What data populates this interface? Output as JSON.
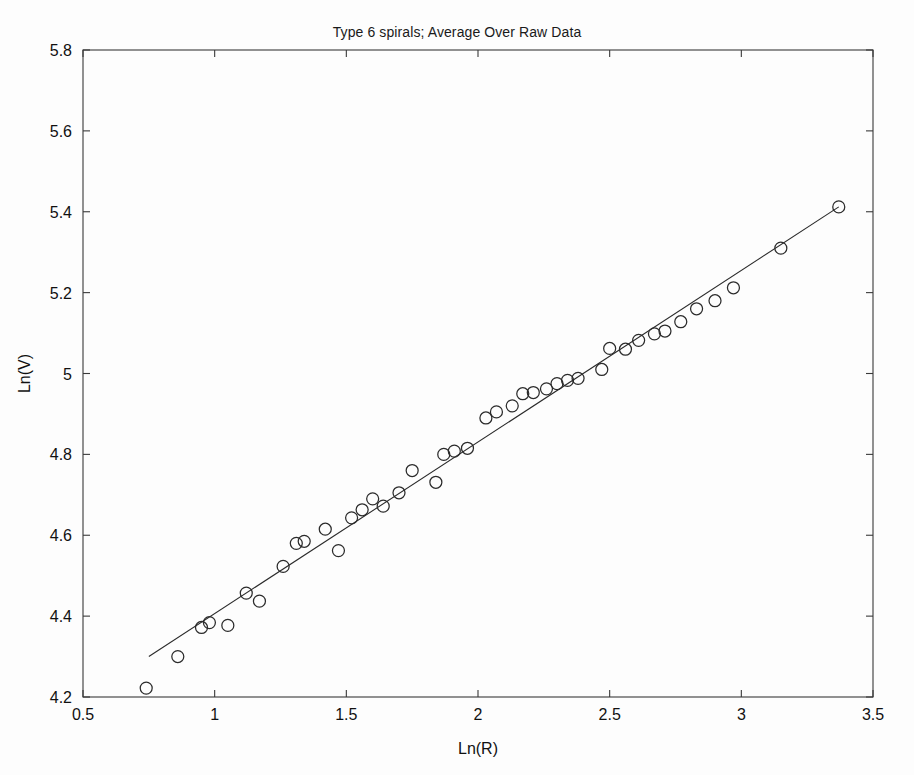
{
  "figure": {
    "width": 914,
    "height": 775,
    "background_color": "#fdfdfd",
    "foreground_color": "#2b2b2b"
  },
  "chart_data": {
    "type": "scatter",
    "title": "Type 6 spirals; Average Over Raw Data",
    "xlabel": "Ln(R)",
    "ylabel": "Ln(V)",
    "xlim": [
      0.5,
      3.5
    ],
    "ylim": [
      4.2,
      5.8
    ],
    "xticks": [
      0.5,
      1,
      1.5,
      2,
      2.5,
      3,
      3.5
    ],
    "xtick_labels": [
      "0.5",
      "1",
      "1.5",
      "2",
      "2.5",
      "3",
      "3.5"
    ],
    "yticks": [
      4.2,
      4.4,
      4.6,
      4.8,
      5.0,
      5.2,
      5.4,
      5.6,
      5.8
    ],
    "ytick_labels": [
      "4.2",
      "4.4",
      "4.6",
      "4.8",
      "5",
      "5.2",
      "5.4",
      "5.6",
      "5.8"
    ],
    "grid": false,
    "legend": null,
    "tick_direction": "in",
    "marker": "open-circle",
    "marker_size": 7,
    "series": [
      {
        "name": "Type 6 spirals (averaged raw data)",
        "kind": "scatter",
        "x": [
          0.74,
          0.86,
          0.95,
          0.98,
          1.05,
          1.12,
          1.17,
          1.26,
          1.31,
          1.34,
          1.42,
          1.47,
          1.52,
          1.56,
          1.6,
          1.64,
          1.7,
          1.75,
          1.84,
          1.87,
          1.91,
          1.96,
          2.03,
          2.07,
          2.13,
          2.17,
          2.21,
          2.26,
          2.3,
          2.34,
          2.38,
          2.47,
          2.5,
          2.56,
          2.61,
          2.67,
          2.71,
          2.77,
          2.83,
          2.9,
          2.97,
          3.15,
          3.37
        ],
        "y": [
          4.222,
          4.3,
          4.372,
          4.384,
          4.377,
          4.457,
          4.437,
          4.523,
          4.58,
          4.585,
          4.615,
          4.562,
          4.643,
          4.663,
          4.69,
          4.672,
          4.705,
          4.76,
          4.731,
          4.8,
          4.808,
          4.815,
          4.89,
          4.905,
          4.92,
          4.95,
          4.953,
          4.962,
          4.975,
          4.983,
          4.988,
          5.01,
          5.062,
          5.06,
          5.082,
          5.098,
          5.105,
          5.128,
          5.16,
          5.18,
          5.212,
          5.31,
          5.412
        ]
      },
      {
        "name": "Linear fit",
        "kind": "line",
        "x": [
          0.75,
          3.37
        ],
        "y": [
          4.3,
          5.412
        ]
      }
    ]
  }
}
